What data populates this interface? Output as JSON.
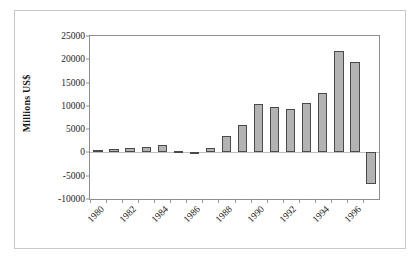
{
  "figure": {
    "y_axis_title": "Millions US$"
  },
  "chart_data": {
    "type": "bar",
    "title": "",
    "xlabel": "",
    "ylabel": "Millions US$",
    "ylim": [
      -10000,
      25000
    ],
    "ytick_values": [
      25000,
      20000,
      15000,
      10000,
      5000,
      0,
      -5000,
      -10000
    ],
    "ytick_labels": [
      "25000",
      "20000",
      "15000",
      "10000",
      "5000",
      "0",
      "-5000",
      "-10000"
    ],
    "grid": false,
    "legend": "none",
    "categories": [
      "1980",
      "1981",
      "1982",
      "1983",
      "1984",
      "1985",
      "1986",
      "1987",
      "1988",
      "1989",
      "1990",
      "1991",
      "1992",
      "1993",
      "1994",
      "1995",
      "1996",
      "1997"
    ],
    "xtick_labels_shown": [
      "1980",
      "1982",
      "1984",
      "1986",
      "1988",
      "1990",
      "1992",
      "1994",
      "1996"
    ],
    "values": [
      500,
      700,
      1000,
      1200,
      1700,
      200,
      -200,
      900,
      3600,
      5900,
      10500,
      9800,
      9300,
      10600,
      12800,
      21800,
      19400,
      -6800
    ],
    "bar_color": "#b3b3b3",
    "bar_edge_color": "#4a4a4a"
  }
}
